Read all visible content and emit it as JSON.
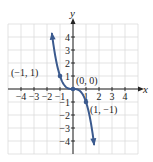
{
  "chart_data": {
    "type": "line",
    "title": "",
    "function": "y = -x^3",
    "xlabel": "x",
    "ylabel": "y",
    "xlim": [
      -5,
      5
    ],
    "ylim": [
      -5,
      5
    ],
    "grid": true,
    "x_ticks": [
      -4,
      -3,
      -2,
      -1,
      1,
      2,
      3,
      4
    ],
    "x_tick_labels": [
      "−4",
      "−3",
      "−2",
      "−1",
      "1",
      "2",
      "3",
      "4"
    ],
    "y_ticks": [
      4,
      3,
      2,
      1,
      -1,
      -2,
      -3,
      -4
    ],
    "y_tick_labels": [
      "4",
      "3",
      "2",
      "1",
      "−1",
      "−2",
      "−3",
      "−4"
    ],
    "x_range_drawn": [
      -1.62,
      1.62
    ],
    "series": [
      {
        "name": "y = -x^3",
        "color": "#3b5a8e",
        "x": [
          -1.6,
          -1.2,
          -1,
          -0.5,
          0,
          0.5,
          1,
          1.2,
          1.6
        ],
        "y": [
          4.096,
          1.728,
          1,
          0.125,
          0,
          -0.125,
          -1,
          -1.728,
          -4.096
        ]
      }
    ],
    "points": [
      {
        "x": -1,
        "y": 1,
        "label": "(−1, 1)"
      },
      {
        "x": 0,
        "y": 0,
        "label": "(0, 0)"
      },
      {
        "x": 1,
        "y": -1,
        "label": "(1, −1)"
      }
    ],
    "legend": null
  },
  "axes": {
    "x_label": "x",
    "y_label": "y"
  },
  "labels": {
    "p1": "(−1, 1)",
    "p2": "(0, 0)",
    "p3": "(1, −1)"
  },
  "colors": {
    "curve": "#3b5a8e",
    "grid": "#dcdcdc",
    "axis": "#222222"
  }
}
